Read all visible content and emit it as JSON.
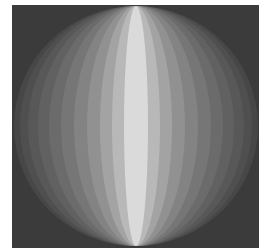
{
  "image": {
    "description": "Shaded sphere rendered as vertical lune bands on dark square background",
    "background_color": "#3b3b3b",
    "sphere": {
      "center_x": 124,
      "center_y": 121,
      "radius_y": 120,
      "radius_x": 122
    },
    "bands": [
      {
        "half_width": 122,
        "color": "#474747"
      },
      {
        "half_width": 116,
        "color": "#4f4f4f"
      },
      {
        "half_width": 108,
        "color": "#585858"
      },
      {
        "half_width": 98,
        "color": "#616161"
      },
      {
        "half_width": 87,
        "color": "#6b6b6b"
      },
      {
        "half_width": 75,
        "color": "#767676"
      },
      {
        "half_width": 62,
        "color": "#838383"
      },
      {
        "half_width": 49,
        "color": "#919191"
      },
      {
        "half_width": 36,
        "color": "#a3a3a3"
      },
      {
        "half_width": 24,
        "color": "#b8b8b8"
      },
      {
        "half_width": 12,
        "color": "#dadada"
      }
    ]
  }
}
